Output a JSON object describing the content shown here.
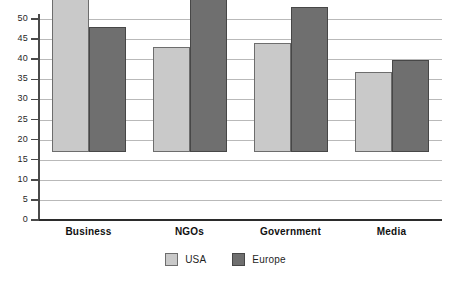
{
  "chart_data": {
    "type": "bar",
    "title": "",
    "subtitle": "",
    "xlabel": "",
    "ylabel": "",
    "categories": [
      "Business",
      "NGOs",
      "Government",
      "Media"
    ],
    "series": [
      {
        "name": "USA",
        "color": "#c9c9c9",
        "values": [
          44,
          26,
          27,
          20
        ]
      },
      {
        "name": "Europe",
        "color": "#6f6f6f",
        "values": [
          31,
          49,
          36,
          23
        ]
      }
    ],
    "ylim": [
      0,
      50
    ],
    "ytick_step": 5,
    "yticks": [
      0,
      5,
      10,
      15,
      20,
      25,
      30,
      35,
      40,
      45,
      50
    ],
    "ytick_labels": [
      "0",
      "5",
      "10",
      "15",
      "20",
      "25",
      "30",
      "35",
      "40",
      "45",
      "50"
    ],
    "grid": true,
    "grid_axis": "y",
    "legend_position": "bottom",
    "legend_entries": [
      "USA",
      "Europe"
    ],
    "annotations": [],
    "colors": {
      "usa": "#c9c9c9",
      "europe": "#6f6f6f",
      "gridline": "#b9b9b9",
      "axis": "#2b2b2b",
      "text": "#1f1f1f",
      "background": "#ffffff"
    }
  }
}
